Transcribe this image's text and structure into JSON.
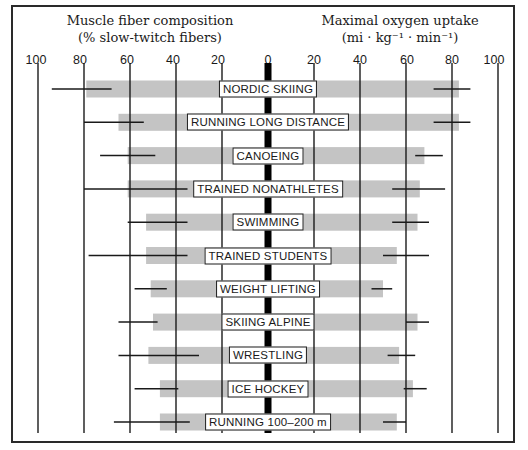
{
  "chart_data": {
    "type": "bar",
    "subtype": "back-to-back horizontal bar with range lines",
    "categories": [
      "NORDIC SKIING",
      "RUNNING LONG DISTANCE",
      "CANOEING",
      "TRAINED NONATHLETES",
      "SWIMMING",
      "TRAINED STUDENTS",
      "WEIGHT LIFTING",
      "SKIING ALPINE",
      "WRESTLING",
      "ICE HOCKEY",
      "RUNNING 100–200 m"
    ],
    "series": [
      {
        "name": "Muscle fiber composition (% slow-twitch fibers)",
        "side": "left",
        "values": [
          79,
          65,
          61,
          61,
          53,
          53,
          51,
          50,
          52,
          47,
          47
        ],
        "range_low": [
          68,
          54,
          49,
          35,
          35,
          35,
          44,
          48,
          30,
          39,
          34
        ],
        "range_high": [
          94,
          80,
          73,
          80,
          61,
          78,
          58,
          65,
          65,
          58,
          67
        ]
      },
      {
        "name": "Maximal oxygen uptake (ml · kg⁻¹ · min⁻¹)",
        "side": "right",
        "values": [
          83,
          83,
          68,
          66,
          65,
          56,
          50,
          65,
          57,
          63,
          56
        ],
        "range_low": [
          72,
          72,
          64,
          54,
          54,
          50,
          45,
          60,
          52,
          59,
          50
        ],
        "range_high": [
          88,
          88,
          76,
          77,
          70,
          70,
          54,
          70,
          64,
          69,
          60
        ]
      }
    ],
    "left_axis": {
      "title": "Muscle fiber composition",
      "subtitle": "(% slow-twitch fibers)",
      "ticks": [
        100,
        80,
        60,
        40,
        20,
        0
      ],
      "range": [
        100,
        0
      ]
    },
    "right_axis": {
      "title": "Maximal oxygen uptake",
      "subtitle": "(ml · kg⁻¹ · min⁻¹)",
      "ticks": [
        0,
        20,
        40,
        60,
        80,
        100
      ],
      "range": [
        0,
        100
      ]
    },
    "grid": true,
    "legend": "none",
    "colors": {
      "bar": "#c4c4c4",
      "line": "#1a1a1a",
      "center": "#000000"
    }
  },
  "titles": {
    "left_title": "Muscle fiber composition",
    "left_subtitle": "(% slow-twitch fibers)",
    "right_title": "Maximal oxygen uptake",
    "right_subtitle": "(mi · kg⁻¹ · min⁻¹)"
  },
  "tick_labels": {
    "left": [
      "100",
      "80",
      "60",
      "40",
      "20",
      "0"
    ],
    "right": [
      "20",
      "40",
      "60",
      "80",
      "100"
    ]
  }
}
